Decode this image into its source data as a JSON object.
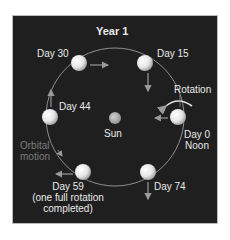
{
  "diagram": {
    "title": "Year 1",
    "sun_label": "Sun",
    "rotation_label": "Rotation",
    "orbital_motion_label": [
      "Orbital",
      "motion"
    ],
    "positions": [
      {
        "day": "Day 0",
        "extra": "Noon"
      },
      {
        "day": "Day 15"
      },
      {
        "day": "Day 30"
      },
      {
        "day": "Day 44"
      },
      {
        "day": "Day 59",
        "extra": [
          "(one full rotation",
          "completed)"
        ]
      },
      {
        "day": "Day 74"
      }
    ],
    "colors": {
      "background": "#1f1f1f",
      "orbit": "#9a9a9a",
      "planet": "#f2f2f2",
      "sun": "#a8a8a8",
      "text": "#eaeaea",
      "muted_text": "#7d7d7d"
    }
  }
}
